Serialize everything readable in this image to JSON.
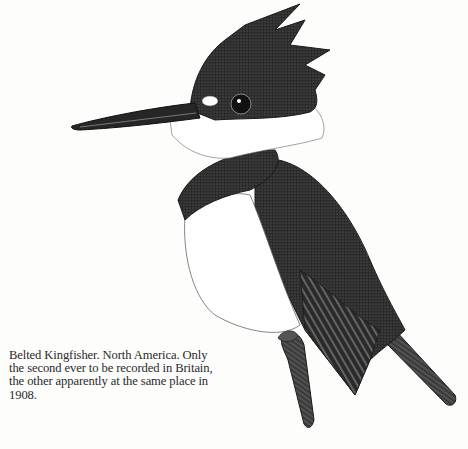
{
  "illustration": {
    "subject": "Belted Kingfisher",
    "style": "pen-and-ink stipple drawing",
    "colors": {
      "ink": "#1a1a1a",
      "dark": "#2b2b2b",
      "mid": "#555555",
      "paper": "#fdfdfc",
      "white": "#ffffff"
    }
  },
  "caption": {
    "lines": [
      "Belted Kingfisher. North America. Only",
      "the second ever to be recorded in Britain,",
      "the other apparently at the same place in",
      "1908."
    ]
  }
}
